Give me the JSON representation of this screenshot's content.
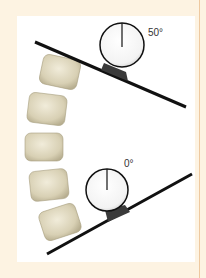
{
  "figure": {
    "inclinometers": [
      {
        "id": "top",
        "label": "50°",
        "angle_deg": 50
      },
      {
        "id": "bottom",
        "label": "0°",
        "angle_deg": 0
      }
    ],
    "vertebrae_count": 5,
    "colors": {
      "background": "#fdf3e2",
      "panel": "#ffffff",
      "line": "#111111",
      "vertebra": "#d9d2b8",
      "rule": "#eec9a0"
    }
  }
}
